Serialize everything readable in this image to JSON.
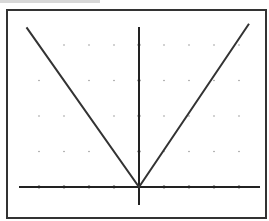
{
  "chart_data": {
    "type": "line",
    "title": "",
    "function": "y = |x|",
    "xlabel": "",
    "ylabel": "",
    "xlim": [
      -5,
      5
    ],
    "ylim": [
      -0.5,
      4.5
    ],
    "x_ticks": [
      -4,
      -3,
      -2,
      -1,
      0,
      1,
      2,
      3,
      4
    ],
    "y_ticks": [
      0,
      1,
      2,
      3,
      4
    ],
    "grid": "dots",
    "legend": null,
    "series": [
      {
        "name": "y = |x|",
        "x": [
          -4.5,
          0,
          4.4
        ],
        "y": [
          4.5,
          0,
          4.6
        ]
      }
    ]
  },
  "layout": {
    "frame": {
      "x": 7,
      "y": 10,
      "w": 259,
      "h": 208
    },
    "origin": {
      "px": 139,
      "py": 187
    },
    "unit_x": 25,
    "unit_y": 35.5,
    "x_axis_px": [
      19,
      260
    ],
    "y_axis_px": [
      27,
      205
    ],
    "colors": {
      "line": "#333333",
      "axis": "#222222",
      "grid": "#999999",
      "frame": "#333333"
    }
  }
}
